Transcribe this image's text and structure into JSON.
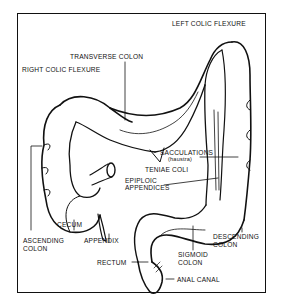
{
  "diagram": {
    "labels": {
      "left_colic_flexure": "LEFT COLIC FLEXURE",
      "transverse_colon": "TRANSVERSE COLON",
      "right_colic_flexure": "RIGHT COLIC FLEXURE",
      "sacculations": "SACCULATIONS",
      "sacculations_sub": "(haustra)",
      "teniae_coli": "TENIAE COLI",
      "epiploic_1": "EPIPLOIC",
      "epiploic_2": "APPENDICES",
      "cecum": "CECUM",
      "ascending_1": "ASCENDING",
      "ascending_2": "COLON",
      "appendix": "APPENDIX",
      "descending_1": "DESCENDING",
      "descending_2": "COLON",
      "sigmoid_1": "SIGMOID",
      "sigmoid_2": "COLON",
      "rectum": "RECTUM",
      "anal_canal": "ANAL CANAL"
    },
    "colors": {
      "ink": "#111111",
      "background": "#ffffff"
    }
  }
}
